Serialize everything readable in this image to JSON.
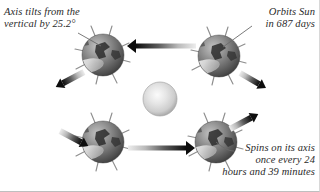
{
  "figure": {
    "background_color": "#ffffff",
    "width": 320,
    "height": 192
  },
  "annotations": {
    "tilt": {
      "text": "Axis tilts from the\nvertical by 25.2°",
      "align": "left",
      "leader_from": [
        78,
        34
      ],
      "leader_to": [
        101,
        46
      ]
    },
    "orbit": {
      "text": "Orbits Sun\nin 687 days",
      "align": "right",
      "leader_from": [
        252,
        27
      ],
      "leader_to": [
        222,
        47
      ]
    },
    "spin": {
      "text": "Spins on its axis\nonce every 24\nhours and 39 minutes",
      "align": "right",
      "leader_from": [
        232,
        150
      ],
      "leader_to": [
        216,
        143
      ]
    }
  },
  "sun": {
    "label": "sun",
    "center": [
      160,
      99
    ],
    "radius": 17,
    "highlight_color": "#f2f2f2",
    "mid_color": "#cfcfcf",
    "edge_color": "#9c9c9c"
  },
  "planets": [
    {
      "label": "mars-top-left",
      "center": [
        103,
        55
      ],
      "radius": 21,
      "axis_tilt_deg": 25.2,
      "spoke_count": 8
    },
    {
      "label": "mars-top-right",
      "center": [
        219,
        56
      ],
      "radius": 21,
      "axis_tilt_deg": 25.2,
      "spoke_count": 8
    },
    {
      "label": "mars-bottom-left",
      "center": [
        103,
        142
      ],
      "radius": 21,
      "axis_tilt_deg": 25.2,
      "spoke_count": 8
    },
    {
      "label": "mars-bottom-right",
      "center": [
        216,
        142
      ],
      "radius": 21,
      "axis_tilt_deg": 25.2,
      "spoke_count": 8
    }
  ],
  "planet_style": {
    "highlight_color": "#b4b4b4",
    "body_color": "#6f6f6f",
    "shadow_color": "#3a3a3a",
    "surface_mark_color": "#2e2e2e",
    "spoke_color": "#8a8a8a",
    "polar_cap_color": "#e8e8e8"
  },
  "arrows": [
    {
      "label": "arrow-top-leftward",
      "direction": "left",
      "from": [
        196,
        46
      ],
      "to": [
        130,
        46
      ],
      "thickness": 5,
      "gradient": "fades from tail to dark head"
    },
    {
      "label": "arrow-bottom-rightward",
      "direction": "right",
      "from": [
        128,
        148
      ],
      "to": [
        192,
        148
      ],
      "thickness": 5,
      "gradient": "fades from tail to dark head"
    },
    {
      "label": "arrow-upper-left-diagonal",
      "direction": "down-left",
      "from": [
        84,
        72
      ],
      "to": [
        56,
        87
      ],
      "thickness": 6,
      "gradient": "fades from tail to dark head"
    },
    {
      "label": "arrow-lower-left-diagonal",
      "direction": "down-right",
      "from": [
        60,
        131
      ],
      "to": [
        88,
        146
      ],
      "thickness": 6,
      "gradient": "fades from tail to dark head"
    },
    {
      "label": "arrow-lower-right-diagonal",
      "direction": "up-right",
      "from": [
        230,
        129
      ],
      "to": [
        258,
        114
      ],
      "thickness": 6,
      "gradient": "fades from tail to dark head"
    },
    {
      "label": "arrow-upper-right-diagonal",
      "direction": "down-right",
      "from": [
        240,
        73
      ],
      "to": [
        262,
        86
      ],
      "thickness": 6,
      "gradient": "fades from tail to dark head"
    }
  ],
  "colors": {
    "ink": "#2a2a2a",
    "leader_line": "#6b6b6b",
    "arrow_dark": "#111111",
    "arrow_light": "#e7e7e7"
  }
}
